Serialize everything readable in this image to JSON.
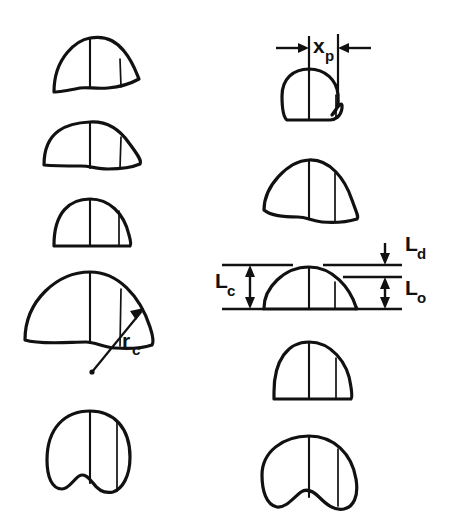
{
  "figure": {
    "type": "technical-line-diagram",
    "background_color": "#ffffff",
    "line_color": "#111111"
  },
  "annotations": {
    "x_p": {
      "base": "x",
      "subscript": "p",
      "kind": "horizontal-dimension",
      "arrow_style": "double-inward",
      "position": "top-right"
    },
    "r_c": {
      "base": "r",
      "subscript": "c",
      "kind": "radius-leader",
      "arrow_style": "single-arrow",
      "position": "left-column-fourth-shape"
    },
    "L_c": {
      "base": "L",
      "subscript": "c",
      "kind": "vertical-dimension",
      "arrow_style": "double-headed",
      "position": "right-of-left-reference-line"
    },
    "L_d": {
      "base": "L",
      "subscript": "d",
      "kind": "vertical-dimension",
      "arrow_style": "down-arrow",
      "position": "top-right-between-upper-lines"
    },
    "L_o": {
      "base": "L",
      "subscript": "o",
      "kind": "vertical-dimension",
      "arrow_style": "double-headed",
      "position": "right-lower"
    }
  },
  "left_column": {
    "label": "left-profile-column",
    "shapes": [
      {
        "id": "left-shape-1",
        "form": "crescent-cap-concave-base"
      },
      {
        "id": "left-shape-2",
        "form": "wide-crescent-concave-base"
      },
      {
        "id": "left-shape-3",
        "form": "dome-flat-base"
      },
      {
        "id": "left-shape-4",
        "form": "broad-dome-wavy-base",
        "annotated_with": "r_c"
      },
      {
        "id": "left-shape-5",
        "form": "round-lobed-notched-base"
      }
    ]
  },
  "right_column": {
    "label": "right-profile-column",
    "shapes": [
      {
        "id": "right-shape-1",
        "form": "small-round-with-side-lobe",
        "annotated_with": "x_p"
      },
      {
        "id": "right-shape-2",
        "form": "wide-crescent-concave-base"
      },
      {
        "id": "right-shape-3",
        "form": "dome-flat-base",
        "annotated_with": "L_c, L_d, L_o"
      },
      {
        "id": "right-shape-4",
        "form": "dome-flat-base"
      },
      {
        "id": "right-shape-5",
        "form": "round-lobed-notched-base"
      }
    ]
  },
  "reference_lines": {
    "top_line": "upper-datum-line",
    "middle_line": "intermediate-datum-line",
    "bottom_line": "lower-datum-line"
  }
}
